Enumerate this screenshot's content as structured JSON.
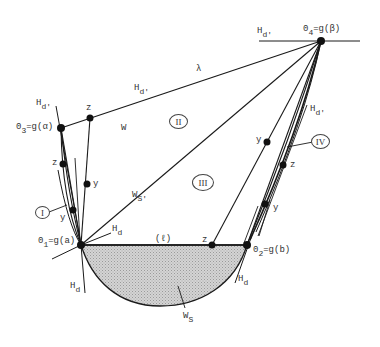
{
  "diagram": {
    "points": {
      "o1": {
        "label_main": "0",
        "label_sub": "1",
        "label_rest": "=g(a)"
      },
      "o2": {
        "label_main": "0",
        "label_sub": "2",
        "label_rest": "=g(b)"
      },
      "o3": {
        "label_main": "0",
        "label_sub": "3",
        "label_rest": "=g(α)"
      },
      "o4": {
        "label_main": "0",
        "label_sub": "4",
        "label_rest": "=g(β)"
      }
    },
    "tangent_labels": {
      "hd_prime_top": {
        "main": "H",
        "sub": "d'"
      },
      "hd_prime_lambda": {
        "main": "H",
        "sub": "d'"
      },
      "hd_prime_left": {
        "main": "H",
        "sub": "d'"
      },
      "hd_prime_right": {
        "main": "H",
        "sub": "d'"
      },
      "hd_o1_right": {
        "main": "H",
        "sub": "d"
      },
      "hd_o1_bottom": {
        "main": "H",
        "sub": "d"
      },
      "hd_o2_bottom": {
        "main": "H",
        "sub": "d"
      }
    },
    "curve_labels": {
      "lambda": "λ",
      "w": "W",
      "ws_prime": {
        "main": "W",
        "sub": "S'"
      },
      "ws": {
        "main": "W",
        "sub": "S"
      },
      "ell": "(ℓ)"
    },
    "point_labels": {
      "z_top": "z",
      "y_mid_left": "y",
      "z_left": "z",
      "y_left": "y",
      "z_segment": "z",
      "y_upper_right": "y",
      "z_right": "z",
      "y_right": "y"
    },
    "regions": {
      "r1": "I",
      "r2": "II",
      "r3": "III",
      "r4": "IV"
    },
    "colors": {
      "line": "#1a1a1a",
      "fill": "#c8c8c8",
      "text": "#333333"
    }
  }
}
